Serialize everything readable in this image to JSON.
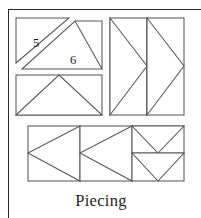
{
  "page": {
    "caption": "Piecing",
    "background_color": "#ffffff",
    "frame_color": "#2b2b2b",
    "line_color": "#585858",
    "label_color": "#1c1c1c"
  },
  "diagram": {
    "title": "Piecing",
    "labels": [
      {
        "id": "5",
        "text": "5"
      },
      {
        "id": "6",
        "text": "6"
      }
    ],
    "units": [
      {
        "name": "half-square-triangle-pair",
        "position": "top-left",
        "pieces": [
          "5",
          "6"
        ],
        "note": "rectangle split on the diagonal with a seam-allowance gap"
      },
      {
        "name": "flying-geese-up",
        "position": "upper-left-lower",
        "pieces": 1,
        "note": "rectangle with apex-up triangle"
      },
      {
        "name": "flying-geese-right-pair",
        "position": "top-right",
        "pieces": 2,
        "note": "square made of two vertical geese pointing right"
      },
      {
        "name": "flying-geese-left",
        "position": "bottom-left",
        "pieces": 1,
        "note": "square with geese pointing left"
      },
      {
        "name": "flying-geese-left",
        "position": "bottom-center",
        "pieces": 1,
        "note": "square with geese pointing left"
      },
      {
        "name": "flying-geese-down-pair",
        "position": "bottom-right",
        "pieces": 2,
        "note": "square made of two horizontal geese pointing down"
      }
    ]
  }
}
